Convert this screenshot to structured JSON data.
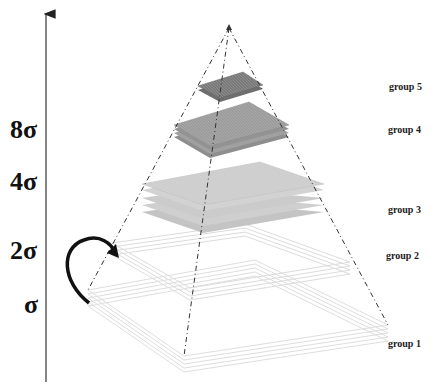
{
  "axis": {
    "labels": [
      {
        "text": "8σ",
        "y": 128
      },
      {
        "text": "4σ",
        "y": 181
      },
      {
        "text": "2σ",
        "y": 250
      },
      {
        "text": "σ",
        "y": 305
      }
    ]
  },
  "groups": [
    {
      "label": "group 5",
      "y": 62
    },
    {
      "label": "group 4",
      "y": 104
    },
    {
      "label": "group 3",
      "y": 213
    },
    {
      "label": "group 2",
      "y": 259
    },
    {
      "label": "group 1",
      "y": 347
    }
  ],
  "colors": {
    "group5": "#7a7a7a",
    "group4": "#9c9c9c",
    "group3": "#c8c8c8",
    "group2": "#e6e6e6",
    "group1": "#e6e6e6",
    "edge": "#333333"
  }
}
